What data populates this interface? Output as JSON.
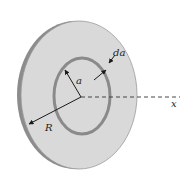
{
  "diagram": {
    "type": "charged-disk-ring-element",
    "labels": {
      "ring_radius": "a",
      "ring_thickness": "da",
      "disk_radius": "R",
      "axis": "x"
    },
    "colors": {
      "disk_face": "#d9d9d9",
      "disk_rim": "#8c8c8c",
      "disk_outline": "#9a9a9a",
      "ring": "#8a8a8a",
      "arrows": "#1a1a1a",
      "axis": "#333333"
    }
  }
}
